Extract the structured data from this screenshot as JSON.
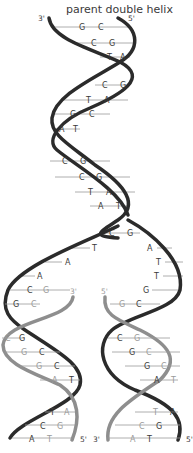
{
  "title": "parent double helix",
  "colors": {
    "parent_strand": "#2b2b2b",
    "new_strand": "#8e8e8e",
    "rung": "#9a9a9a",
    "base_dark": "#3a3a3a",
    "base_light": "#9a9a9a"
  },
  "parent": {
    "ends": {
      "left_top": "3'",
      "right_top": "5'"
    },
    "pairs": [
      [
        "G",
        "C"
      ],
      [
        "C",
        "G"
      ],
      [
        "T",
        "A"
      ],
      [
        "C",
        "G"
      ],
      [
        "T",
        "A"
      ],
      [
        "G",
        "C"
      ],
      [
        "A",
        "T"
      ],
      [
        "C",
        "G"
      ],
      [
        "C",
        "G"
      ],
      [
        "T",
        "A"
      ],
      [
        "A",
        "T"
      ],
      [
        "C",
        "G"
      ]
    ]
  },
  "fork": {
    "left_unpaired": [
      "T",
      "A",
      "A"
    ],
    "right_unpaired": [
      "A",
      "T",
      "T",
      "G"
    ]
  },
  "daughter_left": {
    "ends": {
      "new_top": "3'",
      "bottom_right": "5'"
    },
    "pairs": [
      [
        "C",
        "G"
      ],
      [
        "G",
        "C"
      ],
      [
        "C",
        "G"
      ],
      [
        "G",
        "C"
      ],
      [
        "G",
        "C"
      ],
      [
        "A",
        "T"
      ],
      [
        "T",
        "A"
      ],
      [
        "C",
        "G"
      ],
      [
        "A",
        "T"
      ]
    ]
  },
  "daughter_right": {
    "ends": {
      "new_top": "5'",
      "bottom_left": "3'",
      "bottom_right": "5'"
    },
    "pairs": [
      [
        "G",
        "C"
      ],
      [
        "C",
        "G"
      ],
      [
        "G",
        "C"
      ],
      [
        "G",
        "C"
      ],
      [
        "A",
        "T"
      ],
      [
        "T",
        "A"
      ],
      [
        "C",
        "G"
      ],
      [
        "A",
        "T"
      ]
    ]
  }
}
